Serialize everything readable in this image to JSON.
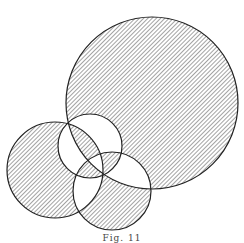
{
  "diagram": {
    "type": "venn-parity",
    "fill_rule": "evenodd",
    "hatch_color": "#555555",
    "stroke_color": "#222222",
    "circles": [
      {
        "name": "large-circle",
        "cx": 152,
        "cy": 103,
        "r": 86
      },
      {
        "name": "left-circle",
        "cx": 55,
        "cy": 170,
        "r": 48
      },
      {
        "name": "top-middle-circle",
        "cx": 90,
        "cy": 146,
        "r": 32
      },
      {
        "name": "bottom-middle-circle",
        "cx": 112,
        "cy": 191,
        "r": 39
      }
    ]
  },
  "caption": "Fig. 11"
}
